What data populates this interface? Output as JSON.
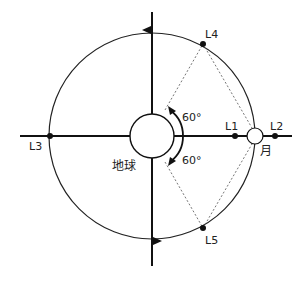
{
  "diagram": {
    "type": "lagrange-points",
    "earth": {
      "label": "地球",
      "cx": 152,
      "cy": 136,
      "r": 22
    },
    "moon": {
      "label": "月",
      "cx": 255,
      "cy": 136,
      "r": 8
    },
    "orbit": {
      "cx": 152,
      "cy": 136,
      "r": 103
    },
    "points": [
      {
        "id": "L1",
        "label": "L1",
        "x": 235,
        "y": 136
      },
      {
        "id": "L2",
        "label": "L2",
        "x": 275,
        "y": 136
      },
      {
        "id": "L3",
        "label": "L3",
        "x": 50,
        "y": 136
      },
      {
        "id": "L4",
        "label": "L4",
        "x": 203,
        "y": 44
      },
      {
        "id": "L5",
        "label": "L5",
        "x": 203,
        "y": 228
      }
    ],
    "angles": [
      {
        "label": "60°",
        "position": "upper"
      },
      {
        "label": "60°",
        "position": "lower"
      }
    ],
    "colors": {
      "line": "#111111",
      "dashed": "#666666",
      "background": "#ffffff"
    }
  }
}
